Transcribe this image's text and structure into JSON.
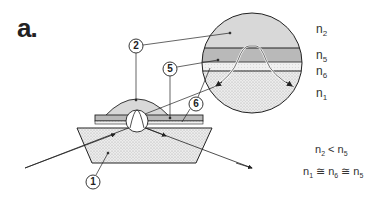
{
  "figure": {
    "panel_label": "a.",
    "callouts": [
      {
        "id": "1",
        "label": "1"
      },
      {
        "id": "2",
        "label": "2"
      },
      {
        "id": "5",
        "label": "5"
      },
      {
        "id": "6",
        "label": "6"
      }
    ],
    "layers": [
      {
        "sym": "n",
        "sub": "2"
      },
      {
        "sym": "n",
        "sub": "5"
      },
      {
        "sym": "n",
        "sub": "6"
      },
      {
        "sym": "n",
        "sub": "1"
      }
    ],
    "equations": {
      "eq1": {
        "a": "n",
        "a_sub": "2",
        "op": " < ",
        "b": "n",
        "b_sub": "5"
      },
      "eq2": {
        "a": "n",
        "a_sub": "1",
        "op1": " ≅ ",
        "b": "n",
        "b_sub": "6",
        "op2": " ≅ ",
        "c": "n",
        "c_sub": "5"
      }
    },
    "colors": {
      "line": "#222222",
      "fill_light": "#e4e4e4",
      "fill_mid": "#cfcfcf"
    }
  }
}
